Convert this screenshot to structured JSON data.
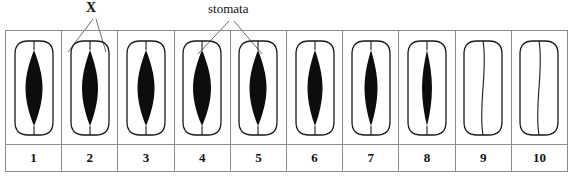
{
  "diagram": {
    "title_labels": [
      {
        "id": "x-label",
        "text": "X",
        "style": "bold"
      },
      {
        "id": "stomata-label",
        "text": "stomata",
        "style": "regular"
      }
    ],
    "label_x": "X",
    "label_stomata": "stomata",
    "colors": {
      "aperture_fill": "#0d0d0d",
      "cell_outline": "#1a1a1a",
      "table_border": "#8c8c8c",
      "background": "#ffffff",
      "text": "#101010"
    },
    "numbers": [
      "1",
      "2",
      "3",
      "4",
      "5",
      "6",
      "7",
      "8",
      "9",
      "10"
    ],
    "cells": [
      {
        "number": "1",
        "name": "stoma-1",
        "aperture_width": 17,
        "open": true,
        "state": "open"
      },
      {
        "number": "2",
        "name": "stoma-2",
        "aperture_width": 16,
        "open": true,
        "state": "open"
      },
      {
        "number": "3",
        "name": "stoma-3",
        "aperture_width": 17,
        "open": true,
        "state": "open"
      },
      {
        "number": "4",
        "name": "stoma-4",
        "aperture_width": 18,
        "open": true,
        "state": "open"
      },
      {
        "number": "5",
        "name": "stoma-5",
        "aperture_width": 17,
        "open": true,
        "state": "open"
      },
      {
        "number": "6",
        "name": "stoma-6",
        "aperture_width": 15,
        "open": true,
        "state": "open"
      },
      {
        "number": "7",
        "name": "stoma-7",
        "aperture_width": 13,
        "open": true,
        "state": "partly-open"
      },
      {
        "number": "8",
        "name": "stoma-8",
        "aperture_width": 10,
        "open": true,
        "state": "partly-open"
      },
      {
        "number": "9",
        "name": "stoma-9",
        "aperture_width": 0,
        "open": false,
        "state": "closed"
      },
      {
        "number": "10",
        "name": "stoma-10",
        "aperture_width": 0,
        "open": false,
        "state": "closed"
      }
    ],
    "leader_lines": [
      {
        "label": "X",
        "from": [
          93,
          18
        ],
        "to": [
          68,
          50
        ]
      },
      {
        "label": "X",
        "from": [
          95,
          18
        ],
        "to": [
          104,
          50
        ]
      },
      {
        "label": "stomata",
        "from": [
          230,
          20
        ],
        "to": [
          200,
          52
        ]
      },
      {
        "label": "stomata",
        "from": [
          234,
          20
        ],
        "to": [
          258,
          52
        ]
      }
    ]
  }
}
